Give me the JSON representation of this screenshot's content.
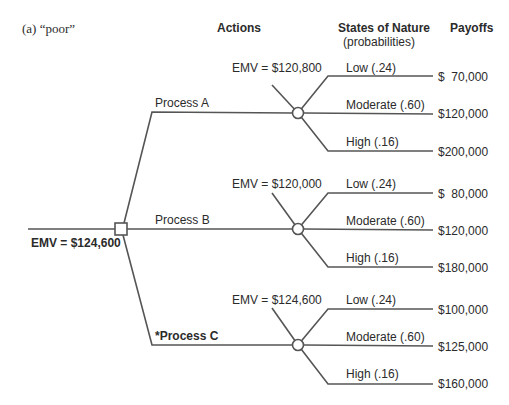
{
  "figure": {
    "label": "(a) “poor”",
    "headers": {
      "actions": "Actions",
      "states": "States of Nature",
      "states_sub": "(probabilities)",
      "payoffs": "Payoffs"
    },
    "root": {
      "emv": "EMV = $124,600"
    },
    "colors": {
      "line": "#555555",
      "text": "#2b2b2b"
    },
    "branches": [
      {
        "action": "Process A",
        "emv": "EMV = $120,800",
        "outcomes": [
          {
            "state": "Low (.24)",
            "payoff": "$  70,000"
          },
          {
            "state": "Moderate (.60)",
            "payoff": "$120,000"
          },
          {
            "state": "High (.16)",
            "payoff": "$200,000"
          }
        ]
      },
      {
        "action": "Process B",
        "emv": "EMV = $120,000",
        "outcomes": [
          {
            "state": "Low (.24)",
            "payoff": "$  80,000"
          },
          {
            "state": "Moderate (.60)",
            "payoff": "$120,000"
          },
          {
            "state": "High (.16)",
            "payoff": "$180,000"
          }
        ]
      },
      {
        "action": "*Process C",
        "emv": "EMV = $124,600",
        "outcomes": [
          {
            "state": "Low (.24)",
            "payoff": "$100,000"
          },
          {
            "state": "Moderate (.60)",
            "payoff": "$125,000"
          },
          {
            "state": "High (.16)",
            "payoff": "$160,000"
          }
        ]
      }
    ]
  }
}
